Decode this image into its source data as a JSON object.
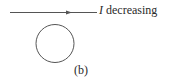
{
  "diagram": {
    "wire_label": {
      "symbol": "I",
      "text": " decreasing"
    },
    "panel_label": "(b)",
    "colors": {
      "stroke": "#555555",
      "text": "#2a2a2a"
    }
  }
}
